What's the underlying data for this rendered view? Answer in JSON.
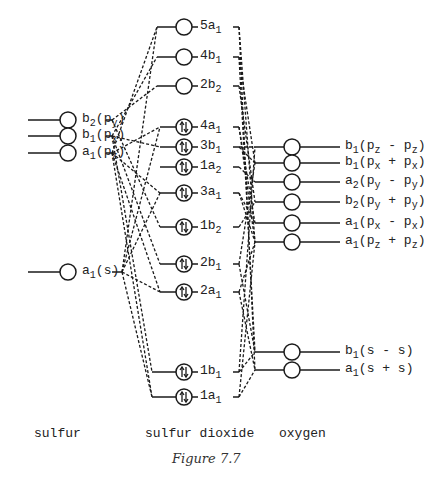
{
  "chart_data": {
    "type": "diagram",
    "title": "Figure 7.7",
    "columns": [
      {
        "name": "sulfur",
        "orbitals": [
          {
            "id": "S_b2py",
            "sym": "b",
            "sub": "2",
            "paren": "(p",
            "psub": "y",
            "close": ")",
            "y": 120
          },
          {
            "id": "S_b1px",
            "sym": "b",
            "sub": "1",
            "paren": "(p",
            "psub": "x",
            "close": ")",
            "y": 136
          },
          {
            "id": "S_a1pz",
            "sym": "a",
            "sub": "1",
            "paren": "(p",
            "psub": "z",
            "close": ")",
            "y": 153
          },
          {
            "id": "S_a1s",
            "sym": "a",
            "sub": "1",
            "paren": "(s)",
            "psub": "",
            "close": "",
            "y": 272
          }
        ]
      },
      {
        "name": "sulfur dioxide",
        "orbitals": [
          {
            "id": "5a1",
            "num": "5",
            "sym": "a",
            "sub": "1",
            "occupied": false,
            "y": 27
          },
          {
            "id": "4b1",
            "num": "4",
            "sym": "b",
            "sub": "1",
            "occupied": false,
            "y": 57
          },
          {
            "id": "2b2",
            "num": "2",
            "sym": "b",
            "sub": "2",
            "occupied": false,
            "y": 86
          },
          {
            "id": "4a1",
            "num": "4",
            "sym": "a",
            "sub": "1",
            "occupied": true,
            "y": 127
          },
          {
            "id": "3b1",
            "num": "3",
            "sym": "b",
            "sub": "1",
            "occupied": true,
            "y": 147
          },
          {
            "id": "1a2",
            "num": "1",
            "sym": "a",
            "sub": "2",
            "occupied": true,
            "y": 167
          },
          {
            "id": "3a1",
            "num": "3",
            "sym": "a",
            "sub": "1",
            "occupied": true,
            "y": 193
          },
          {
            "id": "1b2",
            "num": "1",
            "sym": "b",
            "sub": "2",
            "occupied": true,
            "y": 227
          },
          {
            "id": "2b1",
            "num": "2",
            "sym": "b",
            "sub": "1",
            "occupied": true,
            "y": 264
          },
          {
            "id": "2a1",
            "num": "2",
            "sym": "a",
            "sub": "1",
            "occupied": true,
            "y": 292
          },
          {
            "id": "1b1",
            "num": "1",
            "sym": "b",
            "sub": "1",
            "occupied": true,
            "y": 372
          },
          {
            "id": "1a1",
            "num": "1",
            "sym": "a",
            "sub": "1",
            "occupied": true,
            "y": 397
          }
        ]
      },
      {
        "name": "oxygen",
        "orbitals": [
          {
            "id": "O_b1pz",
            "sym": "b",
            "sub": "1",
            "inner": "(p",
            "s1": "z",
            "op": " - p",
            "s2": "z",
            "y": 147
          },
          {
            "id": "O_b1px",
            "sym": "b",
            "sub": "1",
            "inner": "(p",
            "s1": "x",
            "op": " + p",
            "s2": "x",
            "y": 163
          },
          {
            "id": "O_a2py",
            "sym": "a",
            "sub": "2",
            "inner": "(p",
            "s1": "y",
            "op": " - p",
            "s2": "y",
            "y": 182
          },
          {
            "id": "O_b2py",
            "sym": "b",
            "sub": "2",
            "inner": "(p",
            "s1": "y",
            "op": " + p",
            "s2": "y",
            "y": 202
          },
          {
            "id": "O_a1px",
            "sym": "a",
            "sub": "1",
            "inner": "(p",
            "s1": "x",
            "op": " - p",
            "s2": "x",
            "y": 223
          },
          {
            "id": "O_a1pz",
            "sym": "a",
            "sub": "1",
            "inner": "(p",
            "s1": "z",
            "op": " + p",
            "s2": "z",
            "y": 242
          },
          {
            "id": "O_b1s",
            "sym": "b",
            "sub": "1",
            "inner": "(s - s)",
            "s1": "",
            "op": "",
            "s2": "",
            "y": 352
          },
          {
            "id": "O_a1s",
            "sym": "a",
            "sub": "1",
            "inner": "(s + s)",
            "s1": "",
            "op": "",
            "s2": "",
            "y": 370
          }
        ]
      }
    ],
    "correlation_lines": {
      "sulfur_to_SO2": [
        [
          "S_b2py",
          "2b2"
        ],
        [
          "S_b2py",
          "1b2"
        ],
        [
          "S_b1px",
          "4b1"
        ],
        [
          "S_b1px",
          "3b1"
        ],
        [
          "S_b1px",
          "2b1"
        ],
        [
          "S_b1px",
          "1b1"
        ],
        [
          "S_a1pz",
          "5a1"
        ],
        [
          "S_a1pz",
          "4a1"
        ],
        [
          "S_a1pz",
          "3a1"
        ],
        [
          "S_a1pz",
          "2a1"
        ],
        [
          "S_a1pz",
          "1a1"
        ],
        [
          "S_a1s",
          "5a1"
        ],
        [
          "S_a1s",
          "4a1"
        ],
        [
          "S_a1s",
          "3a1"
        ],
        [
          "S_a1s",
          "2a1"
        ],
        [
          "S_a1s",
          "1a1"
        ]
      ],
      "SO2_to_oxygen": [
        [
          "5a1",
          "O_a1pz"
        ],
        [
          "5a1",
          "O_a1s"
        ],
        [
          "4b1",
          "O_b1px"
        ],
        [
          "4b1",
          "O_b1s"
        ],
        [
          "2b2",
          "O_b2py"
        ],
        [
          "4a1",
          "O_a1px"
        ],
        [
          "4a1",
          "O_a1pz"
        ],
        [
          "3b1",
          "O_b1pz"
        ],
        [
          "3b1",
          "O_b1px"
        ],
        [
          "1a2",
          "O_a2py"
        ],
        [
          "3a1",
          "O_a1px"
        ],
        [
          "3a1",
          "O_a1pz"
        ],
        [
          "1b2",
          "O_b2py"
        ],
        [
          "2b1",
          "O_b1px"
        ],
        [
          "2b1",
          "O_b1s"
        ],
        [
          "2a1",
          "O_a1pz"
        ],
        [
          "2a1",
          "O_a1s"
        ],
        [
          "1b1",
          "O_b1s"
        ],
        [
          "1b1",
          "O_b1pz"
        ],
        [
          "1a1",
          "O_a1s"
        ],
        [
          "1a1",
          "O_a1pz"
        ]
      ]
    }
  },
  "labels": {
    "sulfur": "sulfur",
    "so2": "sulfur dioxide",
    "oxygen": "oxygen",
    "caption": "Figure 7.7"
  },
  "colors": {
    "ink": "#1a1a1a",
    "background": "#ffffff"
  }
}
